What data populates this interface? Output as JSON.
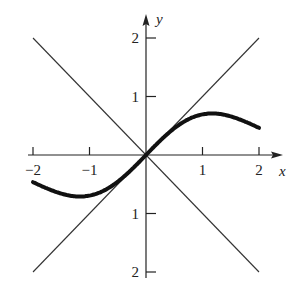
{
  "chart_data": {
    "type": "line",
    "title": "",
    "xlabel": "x",
    "ylabel": "y",
    "xlim": [
      -2,
      2
    ],
    "ylim": [
      -2,
      2
    ],
    "grid": false,
    "x_ticks": [
      -2,
      -1,
      1,
      2
    ],
    "x_tick_labels": [
      "−2",
      "−1",
      "1",
      "2"
    ],
    "y_ticks": [
      2,
      1,
      -1,
      -2
    ],
    "y_tick_labels": [
      "2",
      "1",
      "1",
      "2"
    ],
    "series": [
      {
        "name": "curve",
        "style": "thick",
        "x": [
          -2,
          -1.75,
          -1.5,
          -1.25,
          -1.17,
          -1,
          -0.75,
          -0.5,
          -0.25,
          0,
          0.25,
          0.5,
          0.75,
          1,
          1.17,
          1.25,
          1.5,
          1.75,
          2
        ],
        "y": [
          -0.41,
          -0.58,
          -0.67,
          -0.71,
          -0.72,
          -0.7,
          -0.61,
          -0.45,
          -0.24,
          0,
          0.24,
          0.45,
          0.61,
          0.7,
          0.72,
          0.71,
          0.67,
          0.58,
          0.41
        ]
      },
      {
        "name": "y = x",
        "style": "thin",
        "x": [
          -2,
          2
        ],
        "y": [
          -2,
          2
        ]
      },
      {
        "name": "y = -x",
        "style": "thin",
        "x": [
          -2,
          2
        ],
        "y": [
          2,
          -2
        ]
      }
    ]
  }
}
